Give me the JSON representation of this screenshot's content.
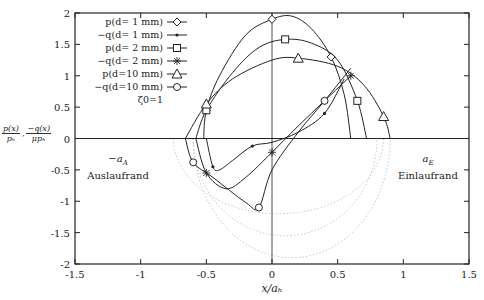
{
  "chart_data": {
    "type": "line",
    "title": "",
    "xlabel": "x/a_h",
    "ylabel": "p(x)/p_h , -q(x)/(mu p_h)",
    "xlim": [
      -1.5,
      1.5
    ],
    "ylim": [
      -2,
      2
    ],
    "x_ticks": [
      "-1.5",
      "-1",
      "-0.5",
      "0",
      "0.5",
      "1",
      "1.5"
    ],
    "y_ticks": [
      "2",
      "1.5",
      "1",
      "0.5",
      "0",
      "-0.5",
      "-1",
      "-1.5",
      "-2"
    ],
    "grid": false,
    "legend_position": "upper-left-inside",
    "legend_note": "ζ0=1",
    "annotations": [
      {
        "text": "-a_A",
        "x": -1.1,
        "y": -0.45
      },
      {
        "text": "Auslaufrand",
        "x": -1.1,
        "y": -0.75
      },
      {
        "text": "a_E",
        "x": 1.15,
        "y": -0.45
      },
      {
        "text": "Einlaufrand",
        "x": 1.15,
        "y": -0.75
      }
    ],
    "series": [
      {
        "name": "p(d= 1 mm)",
        "marker": "diamond",
        "style": "solid",
        "x": [
          -0.52,
          -0.5,
          -0.4,
          -0.2,
          0.0,
          0.15,
          0.3,
          0.45,
          0.55,
          0.6
        ],
        "y": [
          0.0,
          0.45,
          1.0,
          1.65,
          1.9,
          1.95,
          1.75,
          1.3,
          0.7,
          0.0
        ]
      },
      {
        "name": "-q(d= 1 mm)",
        "marker": "dot",
        "style": "solid",
        "x": [
          -0.5,
          -0.45,
          -0.4,
          -0.3,
          -0.15,
          0.0,
          0.2,
          0.4,
          0.55
        ],
        "y": [
          0.0,
          -0.45,
          -0.5,
          -0.35,
          -0.12,
          -0.06,
          0.1,
          0.4,
          0.95
        ]
      },
      {
        "name": "p(d= 2 mm)",
        "marker": "square",
        "style": "solid",
        "x": [
          -0.58,
          -0.5,
          -0.3,
          -0.1,
          0.1,
          0.3,
          0.5,
          0.65,
          0.72
        ],
        "y": [
          0.0,
          0.45,
          1.05,
          1.45,
          1.58,
          1.52,
          1.25,
          0.6,
          0.0
        ]
      },
      {
        "name": "-q(d= 2 mm)",
        "marker": "star",
        "style": "solid",
        "x": [
          -0.58,
          -0.5,
          -0.35,
          -0.2,
          0.0,
          0.2,
          0.4,
          0.6
        ],
        "y": [
          0.0,
          -0.55,
          -0.8,
          -0.62,
          -0.22,
          0.2,
          0.6,
          1.0
        ]
      },
      {
        "name": "p(d=10 mm)",
        "marker": "triangle",
        "style": "solid",
        "x": [
          -0.66,
          -0.5,
          -0.3,
          0.0,
          0.2,
          0.5,
          0.7,
          0.85,
          0.9
        ],
        "y": [
          0.0,
          0.55,
          0.95,
          1.25,
          1.28,
          1.15,
          0.85,
          0.35,
          0.0
        ]
      },
      {
        "name": "-q(d=10 mm)",
        "marker": "circle",
        "style": "solid",
        "x": [
          -0.66,
          -0.6,
          -0.45,
          -0.2,
          -0.1,
          0.0,
          0.2,
          0.4,
          0.6
        ],
        "y": [
          0.0,
          -0.38,
          -0.62,
          -1.02,
          -1.1,
          -0.5,
          0.1,
          0.6,
          1.12
        ]
      }
    ],
    "reference_curves": "dotted elliptical arcs below zero (Hertz-type reference), x≈-0.6..0.9, y down to ≈-1.9"
  },
  "legend": [
    {
      "label": "p(d= 1 mm)",
      "marker": "diamond"
    },
    {
      "label": "−q(d= 1 mm)",
      "marker": "dot"
    },
    {
      "label": "p(d= 2 mm)",
      "marker": "square"
    },
    {
      "label": "−q(d= 2 mm)",
      "marker": "star"
    },
    {
      "label": "p(d=10 mm)",
      "marker": "triangle"
    },
    {
      "label": "−q(d=10 mm)",
      "marker": "circle"
    }
  ],
  "legend_note": "ζ0=1",
  "ylabel": {
    "num1": "p(x)",
    "den1": "pₕ",
    "sep": ",",
    "num2": "−q(x)",
    "den2": "μpₕ"
  },
  "xlabel": "x/aₕ",
  "annotations": {
    "left_symbol": "−a",
    "left_sub": "A",
    "left_text": "Auslaufrand",
    "right_symbol": "a",
    "right_sub": "E",
    "right_text": "Einlaufrand"
  },
  "colors": {
    "line": "#222222",
    "axis": "#222222",
    "dotted": "#bbbbbb"
  }
}
